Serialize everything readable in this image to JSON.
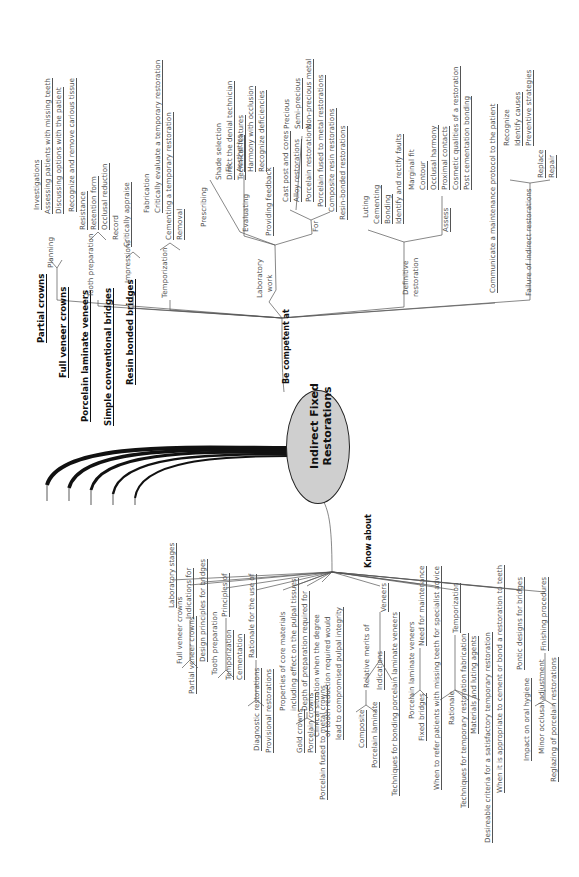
{
  "center": {
    "line1": "Indirect Fixed",
    "line2": "Restorations",
    "fill": "#cfcfcf"
  },
  "branches": {
    "be_competent_at": "Be competent at",
    "know_about": "Know about"
  },
  "clinical_types": [
    {
      "label": "Partial crowns",
      "x": 36,
      "y": 343
    },
    {
      "label": "Full veneer crowns",
      "x": 58,
      "y": 378
    },
    {
      "label": "Porcelain laminate veneers",
      "x": 80,
      "y": 422
    },
    {
      "label": "Simple conventional bridges",
      "x": 103,
      "y": 426
    },
    {
      "label": "Resin bonded bridges",
      "x": 125,
      "y": 385
    }
  ],
  "competent_labels": [
    {
      "t": "Planning",
      "x": 47,
      "y": 268
    },
    {
      "t": "Investigations",
      "x": 33,
      "y": 210,
      "u": 1
    },
    {
      "t": "Assessing patients with missing teeth",
      "x": 44,
      "y": 214,
      "u": 1
    },
    {
      "t": "Discussing options with the patient",
      "x": 55,
      "y": 214,
      "u": 1
    },
    {
      "t": "Tooth preparation",
      "x": 87,
      "y": 297
    },
    {
      "t": "Recognize and remove carious tissue",
      "x": 68,
      "y": 212,
      "u": 1
    },
    {
      "t": "Resistance",
      "x": 79,
      "y": 230,
      "u": 1
    },
    {
      "t": "Retention form",
      "x": 90,
      "y": 230,
      "u": 1
    },
    {
      "t": "Occlusal reduction",
      "x": 101,
      "y": 230,
      "u": 1
    },
    {
      "t": "Impressions",
      "x": 124,
      "y": 283
    },
    {
      "t": "Record",
      "x": 112,
      "y": 240
    },
    {
      "t": "Critically appraise",
      "x": 123,
      "y": 247,
      "u": 1
    },
    {
      "t": "Fabrication",
      "x": 143,
      "y": 213
    },
    {
      "t": "Critically evaluate a temporary restoration",
      "x": 154,
      "y": 213,
      "u": 1
    },
    {
      "t": "Cementing a temporary restoration",
      "x": 165,
      "y": 240,
      "u": 1
    },
    {
      "t": "Removal",
      "x": 176,
      "y": 240,
      "u": 1
    },
    {
      "t": "Temporization",
      "x": 161,
      "y": 298
    },
    {
      "t": "Shade selection",
      "x": 215,
      "y": 180
    },
    {
      "t": "Direct the denial technician",
      "x": 226,
      "y": 180,
      "u": 1
    },
    {
      "t": "Technical features",
      "x": 237,
      "y": 180,
      "u": 1
    },
    {
      "t": "Prescribing",
      "x": 200,
      "y": 227
    },
    {
      "t": "Fit",
      "x": 225,
      "y": 172
    },
    {
      "t": "Aesthetics",
      "x": 236,
      "y": 172,
      "u": 1
    },
    {
      "t": "Harmony with occlusion",
      "x": 247,
      "y": 172,
      "u": 1
    },
    {
      "t": "Recognize deficiencies",
      "x": 258,
      "y": 172,
      "u": 1
    },
    {
      "t": "Evaluating",
      "x": 242,
      "y": 232
    },
    {
      "t": "Providing feedback",
      "x": 265,
      "y": 236,
      "u": 1
    },
    {
      "t": "Cast post and cores",
      "x": 282,
      "y": 202,
      "u": 1
    },
    {
      "t": "Alloy restorations",
      "x": 293,
      "y": 202,
      "u": 1
    },
    {
      "t": "Precious",
      "x": 283,
      "y": 129
    },
    {
      "t": "Semi-precious",
      "x": 294,
      "y": 129,
      "u": 1
    },
    {
      "t": "Non-precious metal",
      "x": 305,
      "y": 129,
      "u": 1
    },
    {
      "t": "Porcelain restorations",
      "x": 305,
      "y": 202,
      "u": 1
    },
    {
      "t": "Porcelain fused to metal restorations",
      "x": 317,
      "y": 207,
      "u": 1
    },
    {
      "t": "Composite resin restorations",
      "x": 328,
      "y": 212,
      "u": 1
    },
    {
      "t": "Resin-bonded restorations",
      "x": 339,
      "y": 220,
      "u": 1
    },
    {
      "t": "For",
      "x": 312,
      "y": 232
    },
    {
      "t": "Laboratory",
      "x": 256,
      "y": 298
    },
    {
      "t": "work",
      "x": 266,
      "y": 292
    },
    {
      "t": "Luting",
      "x": 362,
      "y": 218
    },
    {
      "t": "Cementing",
      "x": 373,
      "y": 224,
      "u": 1
    },
    {
      "t": "Bonding",
      "x": 384,
      "y": 224,
      "u": 1
    },
    {
      "t": "Identify and rectify faults",
      "x": 395,
      "y": 224,
      "u": 1
    },
    {
      "t": "Marginal fit",
      "x": 408,
      "y": 190
    },
    {
      "t": "Contour",
      "x": 419,
      "y": 190,
      "u": 1
    },
    {
      "t": "Occlusal harmony",
      "x": 430,
      "y": 190,
      "u": 1
    },
    {
      "t": "Proximal contacts",
      "x": 441,
      "y": 190,
      "u": 1
    },
    {
      "t": "Cosmetic qualities of a restoration",
      "x": 452,
      "y": 190,
      "u": 1
    },
    {
      "t": "Post cementation bonding",
      "x": 463,
      "y": 190,
      "u": 1
    },
    {
      "t": "Assess",
      "x": 442,
      "y": 232,
      "u": 1
    },
    {
      "t": "Definitive",
      "x": 402,
      "y": 295
    },
    {
      "t": "restoration",
      "x": 412,
      "y": 297
    },
    {
      "t": "Communicate a maintenance protocol to the patient",
      "x": 489,
      "y": 293,
      "u": 1
    },
    {
      "t": "Recognize",
      "x": 503,
      "y": 146
    },
    {
      "t": "Identify causes",
      "x": 514,
      "y": 146,
      "u": 1
    },
    {
      "t": "Preventive strategies",
      "x": 525,
      "y": 146,
      "u": 1
    },
    {
      "t": "Replace",
      "x": 537,
      "y": 178,
      "u": 1
    },
    {
      "t": "Repair",
      "x": 548,
      "y": 178,
      "u": 1
    },
    {
      "t": "Failure of indirect restorations",
      "x": 525,
      "y": 296
    }
  ],
  "know_labels": [
    {
      "t": "Laboratory stages",
      "x": 168,
      "y": 608,
      "u": 1
    },
    {
      "t": "Indications for",
      "x": 185,
      "y": 619,
      "u": 1
    },
    {
      "t": "Full veneer crowns",
      "x": 176,
      "y": 664
    },
    {
      "t": "Partial veneer crowns",
      "x": 188,
      "y": 694,
      "u": 1
    },
    {
      "t": "Design principles for bridges",
      "x": 199,
      "y": 662,
      "u": 1
    },
    {
      "t": "Tooth preparation",
      "x": 211,
      "y": 675
    },
    {
      "t": "Principles of",
      "x": 221,
      "y": 617,
      "u": 1
    },
    {
      "t": "Temporization",
      "x": 225,
      "y": 680,
      "u": 1
    },
    {
      "t": "Cementation",
      "x": 236,
      "y": 680,
      "u": 1
    },
    {
      "t": "Rationale for the use of",
      "x": 248,
      "y": 658,
      "u": 1
    },
    {
      "t": "Diagnostic restorations",
      "x": 253,
      "y": 751,
      "u": 1
    },
    {
      "t": "Provisional restorations",
      "x": 265,
      "y": 753,
      "u": 1
    },
    {
      "t": "Properties of core materials",
      "x": 279,
      "y": 711
    },
    {
      "t": "including effect on the pulpal tissues",
      "x": 290,
      "y": 711,
      "u": 1
    },
    {
      "t": "Depth of preparation required for",
      "x": 301,
      "y": 711,
      "u": 1
    },
    {
      "t": "Gold crowns",
      "x": 296,
      "y": 753,
      "u": 1
    },
    {
      "t": "Porcelain crowns",
      "x": 307,
      "y": 753,
      "u": 1
    },
    {
      "t": "Porcelain fused to metal crowns",
      "x": 319,
      "y": 800,
      "u": 1
    },
    {
      "t": "Clinical situation when the degree",
      "x": 313,
      "y": 737
    },
    {
      "t": "of tooth reduction required would",
      "x": 324,
      "y": 737
    },
    {
      "t": "lead to compromised pulpal integrity",
      "x": 335,
      "y": 740,
      "u": 1
    },
    {
      "t": "Composite",
      "x": 358,
      "y": 748,
      "u": 1
    },
    {
      "t": "Relative merits of",
      "x": 363,
      "y": 688
    },
    {
      "t": "Porcelain laminate",
      "x": 371,
      "y": 768,
      "u": 1
    },
    {
      "t": "Indications",
      "x": 376,
      "y": 690,
      "u": 1
    },
    {
      "t": "Veneers",
      "x": 380,
      "y": 612,
      "u": 1
    },
    {
      "t": "Techniques for bonding porcelain laminate veneers",
      "x": 391,
      "y": 796,
      "u": 1
    },
    {
      "t": "Porcelain laminate veneers",
      "x": 408,
      "y": 719
    },
    {
      "t": "Need for maintenance",
      "x": 418,
      "y": 646,
      "u": 1
    },
    {
      "t": "Fixed bridges",
      "x": 418,
      "y": 741,
      "u": 1
    },
    {
      "t": "When to refer patients with missing teeth for specialist advice",
      "x": 433,
      "y": 790,
      "u": 1
    },
    {
      "t": "Rationale",
      "x": 448,
      "y": 725
    },
    {
      "t": "Temporization",
      "x": 452,
      "y": 633,
      "u": 1
    },
    {
      "t": "Techniques for temporary restoration fabrication",
      "x": 460,
      "y": 808,
      "u": 1
    },
    {
      "t": "Materials and luting agents",
      "x": 470,
      "y": 734,
      "u": 1
    },
    {
      "t": "Desireable criteria for a satisfactory temporary restoration",
      "x": 484,
      "y": 843,
      "u": 1
    },
    {
      "t": "When it is appropriate to cement or bond a restoration to teeth",
      "x": 496,
      "y": 793,
      "u": 1
    },
    {
      "t": "Pontic designs for bridges",
      "x": 516,
      "y": 670,
      "u": 1
    },
    {
      "t": "Impact on oral hygiene",
      "x": 523,
      "y": 761,
      "u": 1
    },
    {
      "t": "Minor occlusal adjustment",
      "x": 538,
      "y": 754
    },
    {
      "t": "Finishing procedures",
      "x": 540,
      "y": 651,
      "u": 1
    },
    {
      "t": "Reglazing of porcelain restorations",
      "x": 550,
      "y": 782,
      "u": 1
    }
  ]
}
